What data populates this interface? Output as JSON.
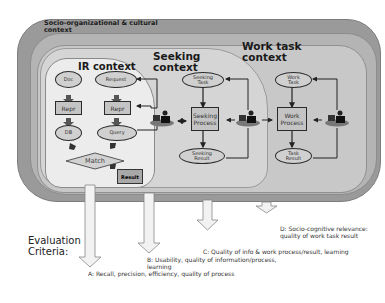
{
  "diagram": {
    "layers": {
      "socio": "Socio-organizational & cultural context",
      "work": "Work task context",
      "seeking": "Seeking context",
      "ir": "IR context"
    },
    "ir_nodes": {
      "doc": "Doc",
      "request": "Request",
      "repr_left": "Repr",
      "repr_right": "Repr",
      "db": "DB",
      "query": "Query",
      "match": "Match",
      "result": "Result"
    },
    "seeking_nodes": {
      "task": "Seeking Task",
      "process": "Seeking Process",
      "result": "Seeking Result"
    },
    "work_nodes": {
      "task": "Work Task",
      "process": "Work Process",
      "result": "Task Result"
    },
    "actors": [
      "ir-searcher",
      "seeking-actor",
      "work-actor"
    ]
  },
  "evaluation": {
    "title": "Evaluation Criteria:",
    "criteria": {
      "a": "A: Recall, precision, efficiency, quality of process",
      "b": "B: Usability, quality of information/process, learning",
      "c": "C: Quality of info & work process/result, learning",
      "d": "D: Socio-cognitive relevance: quality of work task result"
    }
  },
  "colors": {
    "outer": "#9a9a9a",
    "work": "#b4b4b4",
    "seeking": "#c8c8c8",
    "ir": "#ececec",
    "line": "#222222"
  }
}
